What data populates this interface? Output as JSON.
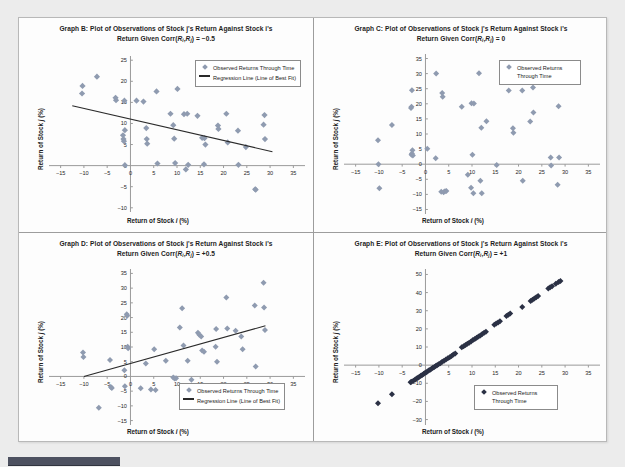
{
  "page": {
    "background_color": "#ececec",
    "sheet_color": "#fdfdfd",
    "bottom_bar_color": "#4d5160"
  },
  "style": {
    "marker_color": "#8f9bb0",
    "marker_color_dark": "#2b3145",
    "regression_line_color": "#2a2a2a",
    "axis_color": "#9a9a9a",
    "text_color": "#1d1d1d"
  },
  "common": {
    "xlabel": "Return of Stock i (%)",
    "ylabel": "Return of Stock j (%)",
    "legend_observed": "Observed Returns Through Time",
    "legend_regression": "Regression Line (Line of Best Fit)"
  },
  "chart_data": [
    {
      "id": "graph-b",
      "type": "scatter",
      "title_line1": "Graph B: Plot of Observations of Stock j's Return Against Stock i's",
      "title_line2": "Return Given Corr(Ri,Rj) = -0.5",
      "corr": -0.5,
      "xlabel": "Return of Stock i (%)",
      "ylabel": "Return of Stock j (%)",
      "xlim": [
        -17.5,
        37.5
      ],
      "ylim": [
        -11,
        26
      ],
      "xticks": [
        -15,
        -10,
        -5,
        0,
        5,
        10,
        15,
        20,
        25,
        30,
        35
      ],
      "yticks": [
        -10,
        -5,
        0,
        5,
        10,
        15,
        20,
        25
      ],
      "grid": false,
      "legend_position": "top-right",
      "legend_entries": [
        "Observed Returns Through Time",
        "Regression Line (Line of Best Fit)"
      ],
      "regression_line": {
        "x": [
          -12.5,
          30.5
        ],
        "y": [
          14.2,
          3.3
        ]
      },
      "points": [
        [
          -10.3,
          18.9
        ],
        [
          -10.4,
          17.1
        ],
        [
          -7.2,
          21.1
        ],
        [
          -3.2,
          16.1
        ],
        [
          -3.1,
          15.5
        ],
        [
          -1.3,
          15.4
        ],
        [
          -1.2,
          8.4
        ],
        [
          -1.6,
          7.2
        ],
        [
          -1.5,
          6.3
        ],
        [
          -1.4,
          5.8
        ],
        [
          -1.2,
          0.1
        ],
        [
          1.3,
          15.4
        ],
        [
          2.8,
          15.2
        ],
        [
          3.4,
          8.9
        ],
        [
          3.5,
          6.3
        ],
        [
          3.6,
          5.2
        ],
        [
          5.6,
          17.6
        ],
        [
          5.8,
          0.5
        ],
        [
          8.6,
          12.3
        ],
        [
          9.2,
          9.6
        ],
        [
          9.4,
          6.4
        ],
        [
          9.6,
          0.6
        ],
        [
          10.1,
          18.2
        ],
        [
          11.5,
          12.2
        ],
        [
          12.2,
          12.3
        ],
        [
          11.9,
          -0.9
        ],
        [
          12.4,
          0.2
        ],
        [
          14.4,
          11.8
        ],
        [
          15.4,
          6.6
        ],
        [
          15.9,
          6.5
        ],
        [
          16.1,
          5.0
        ],
        [
          15.8,
          0.3
        ],
        [
          18.8,
          9.5
        ],
        [
          18.9,
          8.7
        ],
        [
          20.6,
          12.3
        ],
        [
          20.9,
          5.5
        ],
        [
          23.1,
          8.3
        ],
        [
          23.2,
          0.2
        ],
        [
          24.8,
          4.4
        ],
        [
          26.8,
          -5.6
        ],
        [
          26.9,
          -5.7
        ],
        [
          28.8,
          12.0
        ],
        [
          28.6,
          9.7
        ],
        [
          28.9,
          6.3
        ]
      ]
    },
    {
      "id": "graph-c",
      "type": "scatter",
      "title_line1": "Graph C: Plot of Observations of Stock j's Return Against Stock i's",
      "title_line2": "Return Given Corr(Ri,Rj) = 0",
      "corr": 0,
      "xlabel": "Return of Stock i (%)",
      "ylabel": "Return of Stock j (%)",
      "xlim": [
        -17.5,
        37.5
      ],
      "ylim": [
        -16.5,
        36.5
      ],
      "xticks": [
        -15,
        -10,
        -5,
        0,
        5,
        10,
        15,
        20,
        25,
        30,
        35
      ],
      "yticks": [
        -15,
        -10,
        -5,
        0,
        5,
        10,
        15,
        20,
        25,
        30,
        35
      ],
      "grid": false,
      "legend_position": "top-right",
      "legend_entries": [
        "Observed Returns Through Time"
      ],
      "regression_line": null,
      "points": [
        [
          -10.2,
          7.9
        ],
        [
          -10.1,
          0.0
        ],
        [
          -9.9,
          -8.0
        ],
        [
          -7.2,
          13.0
        ],
        [
          -2.9,
          24.5
        ],
        [
          -3.0,
          19.0
        ],
        [
          -3.1,
          18.6
        ],
        [
          -2.8,
          4.6
        ],
        [
          -2.9,
          3.5
        ],
        [
          -3.0,
          3.1
        ],
        [
          -2.7,
          2.9
        ],
        [
          0.4,
          5.1
        ],
        [
          2.3,
          30.0
        ],
        [
          2.2,
          2.0
        ],
        [
          3.6,
          23.6
        ],
        [
          3.7,
          22.3
        ],
        [
          3.4,
          -9.1
        ],
        [
          3.9,
          -9.3
        ],
        [
          4.2,
          -9.0
        ],
        [
          4.5,
          -8.9
        ],
        [
          7.8,
          19.0
        ],
        [
          9.1,
          -3.5
        ],
        [
          9.9,
          20.2
        ],
        [
          10.4,
          20.1
        ],
        [
          10.1,
          3.1
        ],
        [
          9.8,
          -7.8
        ],
        [
          10.3,
          -9.6
        ],
        [
          11.5,
          30.1
        ],
        [
          11.8,
          -5.5
        ],
        [
          12.1,
          -9.6
        ],
        [
          12.0,
          12.1
        ],
        [
          13.1,
          14.2
        ],
        [
          15.3,
          -0.3
        ],
        [
          17.9,
          24.4
        ],
        [
          18.8,
          11.9
        ],
        [
          18.9,
          10.4
        ],
        [
          20.8,
          24.4
        ],
        [
          20.9,
          -5.5
        ],
        [
          22.5,
          14.1
        ],
        [
          23.1,
          25.4
        ],
        [
          23.2,
          17.1
        ],
        [
          26.9,
          2.2
        ],
        [
          27.0,
          -0.4
        ],
        [
          28.6,
          19.2
        ],
        [
          28.7,
          2.2
        ],
        [
          28.4,
          -6.8
        ]
      ]
    },
    {
      "id": "graph-d",
      "type": "scatter",
      "title_line1": "Graph D: Plot of Observations of Stock j's Return Against Stock i's",
      "title_line2": "Return Given Corr(Ri,Rj) = +0.5",
      "corr": 0.5,
      "xlabel": "Return of Stock i (%)",
      "ylabel": "Return of Stock j (%)",
      "xlim": [
        -17.5,
        37.5
      ],
      "ylim": [
        -16.5,
        36.5
      ],
      "xticks": [
        -15,
        -10,
        -5,
        0,
        5,
        10,
        15,
        20,
        25,
        30,
        35
      ],
      "yticks": [
        -15,
        -10,
        -5,
        0,
        5,
        10,
        15,
        20,
        25,
        30,
        35
      ],
      "grid": false,
      "legend_position": "bottom-right",
      "legend_entries": [
        "Observed Returns Through Time",
        "Regression Line (Line of Best Fit)"
      ],
      "regression_line": {
        "x": [
          -10.0,
          29.0
        ],
        "y": [
          0.0,
          17.2
        ]
      },
      "points": [
        [
          -10.2,
          8.1
        ],
        [
          -10.1,
          6.6
        ],
        [
          -6.8,
          -10.6
        ],
        [
          -4.4,
          5.6
        ],
        [
          -4.2,
          -3.6
        ],
        [
          -4.0,
          -3.9
        ],
        [
          -1.3,
          2.1
        ],
        [
          -1.2,
          -3.3
        ],
        [
          -0.8,
          21.1
        ],
        [
          -0.7,
          20.6
        ],
        [
          -0.6,
          10.1
        ],
        [
          -0.5,
          9.6
        ],
        [
          2.2,
          -4.0
        ],
        [
          3.3,
          4.4
        ],
        [
          4.4,
          -4.4
        ],
        [
          5.1,
          9.2
        ],
        [
          5.4,
          -4.6
        ],
        [
          7.6,
          5.3
        ],
        [
          9.2,
          -0.4
        ],
        [
          9.5,
          -0.7
        ],
        [
          9.8,
          -0.6
        ],
        [
          10.6,
          16.6
        ],
        [
          11.1,
          23.2
        ],
        [
          11.4,
          10.5
        ],
        [
          12.3,
          5.3
        ],
        [
          13.1,
          -1.1
        ],
        [
          14.5,
          14.8
        ],
        [
          14.8,
          14.2
        ],
        [
          15.2,
          13.6
        ],
        [
          15.4,
          8.8
        ],
        [
          15.8,
          8.4
        ],
        [
          18.4,
          16.1
        ],
        [
          18.3,
          10.1
        ],
        [
          18.6,
          5.0
        ],
        [
          20.6,
          26.8
        ],
        [
          20.8,
          16.3
        ],
        [
          22.6,
          15.5
        ],
        [
          23.8,
          13.6
        ],
        [
          24.1,
          9.2
        ],
        [
          26.7,
          24.1
        ],
        [
          26.9,
          3.4
        ],
        [
          28.6,
          31.8
        ],
        [
          28.7,
          23.4
        ],
        [
          28.9,
          15.8
        ]
      ]
    },
    {
      "id": "graph-e",
      "type": "scatter",
      "title_line1": "Graph E: Plot of Observations of Stock j's Return Against Stock i's",
      "title_line2": "Return Given Corr(Ri,Rj) = +1",
      "corr": 1,
      "xlabel": "Return of Stock i (%)",
      "ylabel": "Return of Stock j (%)",
      "xlim": [
        -17.5,
        37.5
      ],
      "ylim": [
        -33,
        53
      ],
      "xticks": [
        -15,
        -10,
        -5,
        0,
        5,
        10,
        15,
        20,
        25,
        30,
        35
      ],
      "yticks": [
        -30,
        -20,
        -10,
        0,
        10,
        20,
        30,
        40,
        50
      ],
      "grid": false,
      "legend_position": "bottom-right",
      "legend_entries": [
        "Observed Returns Through Time"
      ],
      "regression_line": null,
      "points": [
        [
          -10.2,
          -21.0
        ],
        [
          -7.2,
          -16.0
        ],
        [
          -3.2,
          -9.5
        ],
        [
          -3.0,
          -9.2
        ],
        [
          -2.6,
          -8.6
        ],
        [
          -2.2,
          -7.9
        ],
        [
          -1.9,
          -7.4
        ],
        [
          -1.6,
          -6.9
        ],
        [
          -1.3,
          -6.4
        ],
        [
          -1.0,
          -5.9
        ],
        [
          -0.7,
          -5.4
        ],
        [
          -0.4,
          -4.9
        ],
        [
          -0.2,
          -4.5
        ],
        [
          0.1,
          -4.0
        ],
        [
          0.4,
          -3.5
        ],
        [
          0.7,
          -3.0
        ],
        [
          1.0,
          -2.5
        ],
        [
          1.3,
          -2.0
        ],
        [
          1.6,
          -1.5
        ],
        [
          1.9,
          -1.0
        ],
        [
          2.2,
          -0.5
        ],
        [
          2.5,
          0.0
        ],
        [
          2.8,
          0.5
        ],
        [
          3.2,
          1.1
        ],
        [
          3.6,
          1.8
        ],
        [
          4.0,
          2.4
        ],
        [
          4.4,
          3.1
        ],
        [
          4.8,
          3.8
        ],
        [
          5.2,
          4.4
        ],
        [
          5.6,
          5.1
        ],
        [
          6.0,
          5.8
        ],
        [
          6.4,
          6.4
        ],
        [
          7.8,
          9.8
        ],
        [
          8.2,
          10.4
        ],
        [
          8.6,
          11.1
        ],
        [
          9.0,
          11.8
        ],
        [
          9.4,
          12.4
        ],
        [
          9.8,
          13.1
        ],
        [
          10.2,
          13.8
        ],
        [
          10.6,
          14.4
        ],
        [
          11.0,
          15.1
        ],
        [
          11.4,
          15.8
        ],
        [
          11.8,
          16.4
        ],
        [
          12.2,
          17.1
        ],
        [
          12.6,
          17.8
        ],
        [
          13.0,
          18.4
        ],
        [
          14.8,
          22.2
        ],
        [
          15.2,
          22.9
        ],
        [
          15.6,
          23.5
        ],
        [
          16.0,
          24.2
        ],
        [
          17.4,
          27.1
        ],
        [
          17.8,
          27.8
        ],
        [
          18.2,
          28.4
        ],
        [
          20.8,
          32.1
        ],
        [
          22.6,
          35.4
        ],
        [
          23.0,
          36.1
        ],
        [
          23.4,
          36.8
        ],
        [
          23.8,
          37.4
        ],
        [
          24.2,
          38.1
        ],
        [
          26.4,
          42.2
        ],
        [
          26.8,
          42.9
        ],
        [
          27.2,
          43.5
        ],
        [
          28.0,
          44.8
        ],
        [
          28.6,
          45.9
        ],
        [
          29.0,
          46.4
        ]
      ]
    }
  ]
}
